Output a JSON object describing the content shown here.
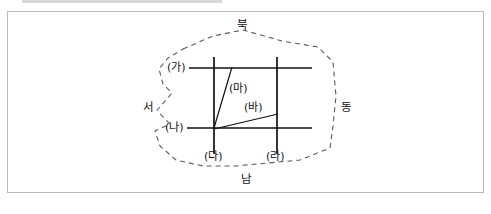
{
  "figure": {
    "type": "schematic-map",
    "colors": {
      "frame": "#b9b9b9",
      "boundary_dashed": "#5a5a5a",
      "road": "#111111",
      "text": "#111111",
      "background": "#ffffff"
    }
  },
  "compass": {
    "north": "북",
    "south": "남",
    "east": "동",
    "west": "서"
  },
  "roads": {
    "horizontal": [
      {
        "id": "ga",
        "label": "(가)"
      },
      {
        "id": "na",
        "label": "(나)"
      }
    ],
    "vertical": [
      {
        "id": "da",
        "label": "(다)"
      },
      {
        "id": "ra",
        "label": "(라)"
      }
    ],
    "diagonal": [
      {
        "id": "ma",
        "label": "(마)"
      },
      {
        "id": "ba",
        "label": "(바)"
      }
    ]
  },
  "geometry": {
    "boundary_points": "183,49 213,36 243,30 282,41 318,47 333,62 336,96 333,126 330,148 300,160 268,163 235,166 203,166 176,160 160,146 155,131 170,124 163,117 157,110 166,100 172,93 163,84 159,69 168,58",
    "boundary_dash": "5,4",
    "horizontal_lines": [
      {
        "id": "ga",
        "x1": 189,
        "y1": 68,
        "x2": 312,
        "y2": 68
      },
      {
        "id": "na",
        "x1": 187,
        "y1": 128,
        "x2": 312,
        "y2": 128
      }
    ],
    "vertical_lines": [
      {
        "id": "da",
        "x1": 214,
        "y1": 57,
        "x2": 214,
        "y2": 154
      },
      {
        "id": "ra",
        "x1": 277,
        "y1": 57,
        "x2": 277,
        "y2": 154
      }
    ],
    "diagonal_lines": [
      {
        "id": "ma",
        "x1": 232,
        "y1": 67,
        "x2": 214,
        "y2": 128
      },
      {
        "id": "ba",
        "x1": 214,
        "y1": 129,
        "x2": 278,
        "y2": 114
      }
    ]
  },
  "label_positions": {
    "buk": {
      "left": 237,
      "top": 20
    },
    "nam": {
      "left": 241,
      "top": 174
    },
    "dong": {
      "left": 341,
      "top": 102
    },
    "seo": {
      "left": 143,
      "top": 102
    },
    "ga": {
      "left": 167,
      "top": 62
    },
    "na": {
      "left": 165,
      "top": 122
    },
    "da": {
      "left": 204,
      "top": 151
    },
    "ra": {
      "left": 266,
      "top": 151
    },
    "ma": {
      "left": 229,
      "top": 83
    },
    "ba": {
      "left": 244,
      "top": 102
    }
  }
}
